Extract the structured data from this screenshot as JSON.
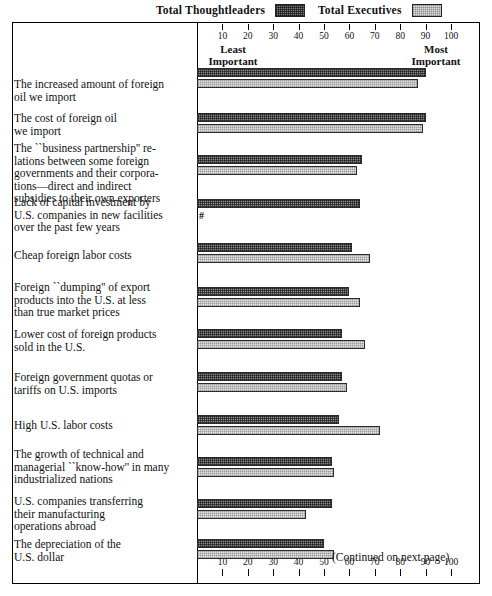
{
  "legend": {
    "items": [
      {
        "label": "Total Thoughtleaders",
        "swatch": "dark-crosshatch-swatch",
        "color": "#7d7d7d"
      },
      {
        "label": "Total Executives",
        "swatch": "light-crosshatch-swatch",
        "color": "#e2e2e2"
      }
    ]
  },
  "axis": {
    "ticks": [
      10,
      20,
      30,
      40,
      50,
      60,
      70,
      80,
      90,
      100
    ],
    "left_anchor": "Least\nImportant",
    "left_anchor_line1": "Least",
    "left_anchor_line2": "Important",
    "right_anchor_line1": "Most",
    "right_anchor_line2": "Important",
    "min": 0,
    "max": 105
  },
  "footer": {
    "continued": "(Continued on next page)"
  },
  "markers": {
    "negligible": "#"
  },
  "chart_data": {
    "type": "bar",
    "orientation": "horizontal",
    "title": "",
    "xlabel": "",
    "ylabel": "",
    "xlim": [
      0,
      105
    ],
    "grid": false,
    "legend_position": "top",
    "categories": [
      "The increased amount of foreign oil we import",
      "The cost of foreign oil we import",
      "The ``business partnership'' relations between some foreign governments and their corporations—direct and indirect subsidies to their own exporters",
      "Lack of capital investment by U.S. companies in new facilities over the past few years",
      "Cheap foreign labor costs",
      "Foreign ``dumping'' of export products into the U.S. at less than true market prices",
      "Lower cost of foreign products sold in the U.S.",
      "Foreign government quotas or tariffs on U.S. imports",
      "High U.S. labor costs",
      "The growth of technical and managerial ``know-how'' in many industrialized nations",
      "U.S. companies transferring their manufacturing operations abroad",
      "The depreciation of the U.S. dollar"
    ],
    "series": [
      {
        "name": "Total Thoughtleaders",
        "color": "#8a8a8a",
        "values": [
          90,
          90,
          65,
          64,
          61,
          60,
          57,
          57,
          56,
          53,
          53,
          50
        ]
      },
      {
        "name": "Total Executives",
        "color": "#e3e3e3",
        "values": [
          87,
          89,
          63,
          0,
          68,
          64,
          66,
          59,
          72,
          54,
          43,
          54
        ]
      }
    ]
  },
  "rows": [
    {
      "label_lines": [
        "The increased amount of foreign",
        "oil we import"
      ],
      "top": 68,
      "label_top": 78
    },
    {
      "label_lines": [
        "The cost of foreign oil",
        "we import"
      ],
      "top": 113,
      "label_top": 112
    },
    {
      "label_lines": [
        "The ``business partnership'' re-",
        "lations between some foreign",
        "governments and their corpora-",
        "tions—direct and indirect",
        "subsidies to their own exporters"
      ],
      "top": 155,
      "label_top": 142
    },
    {
      "label_lines": [
        "Lack of capital investment by",
        "U.S. companies in new facilities",
        "over the past few years"
      ],
      "top": 199,
      "label_top": 196
    },
    {
      "label_lines": [
        "Cheap foreign labor costs"
      ],
      "top": 243,
      "label_top": 249
    },
    {
      "label_lines": [
        "Foreign ``dumping'' of export",
        "products into the U.S. at less",
        "than true market prices"
      ],
      "top": 287,
      "label_top": 281
    },
    {
      "label_lines": [
        "Lower cost of foreign products",
        "sold in the U.S."
      ],
      "top": 329,
      "label_top": 328
    },
    {
      "label_lines": [
        "Foreign government quotas or",
        "tariffs on U.S. imports"
      ],
      "top": 372,
      "label_top": 371
    },
    {
      "label_lines": [
        "High U.S. labor costs"
      ],
      "top": 415,
      "label_top": 419
    },
    {
      "label_lines": [
        "The growth of technical and",
        "managerial ``know-how'' in many",
        "industrialized nations"
      ],
      "top": 457,
      "label_top": 448
    },
    {
      "label_lines": [
        "U.S. companies transferring",
        "their manufacturing",
        "operations abroad"
      ],
      "top": 499,
      "label_top": 495
    },
    {
      "label_lines": [
        "The depreciation of the",
        "U.S. dollar"
      ],
      "top": 539,
      "label_top": 538
    }
  ]
}
